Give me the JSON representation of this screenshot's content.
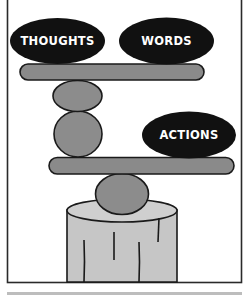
{
  "diagram": {
    "type": "balancing-stones-illustration",
    "labels": {
      "thoughts": "THOUGHTS",
      "words": "WORDS",
      "actions": "ACTIONS"
    },
    "colors": {
      "background": "#ffffff",
      "frame": "#2a2a2a",
      "label_stone": "#111111",
      "label_text": "#ffffff",
      "plank": "#8a8a8a",
      "stone": "#8c8c8c",
      "stump": "#c6c6c6",
      "outline": "#1a1a1a",
      "bottom_bar": "#bdbdbd"
    },
    "elements": [
      {
        "name": "thoughts-stone",
        "kind": "ellipse",
        "label": "THOUGHTS"
      },
      {
        "name": "words-stone",
        "kind": "ellipse",
        "label": "WORDS"
      },
      {
        "name": "top-plank",
        "kind": "plank"
      },
      {
        "name": "upper-balance-stone",
        "kind": "stone"
      },
      {
        "name": "middle-balance-stone",
        "kind": "stone"
      },
      {
        "name": "actions-stone",
        "kind": "ellipse",
        "label": "ACTIONS"
      },
      {
        "name": "lower-plank",
        "kind": "plank"
      },
      {
        "name": "base-stone",
        "kind": "stone"
      },
      {
        "name": "tree-stump",
        "kind": "stump"
      }
    ]
  }
}
